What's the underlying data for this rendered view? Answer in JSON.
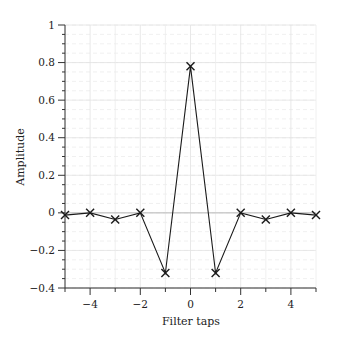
{
  "chart_data": {
    "type": "line",
    "title": "",
    "xlabel": "Filter taps",
    "ylabel": "Amplitude",
    "xlim": [
      -5,
      5
    ],
    "ylim": [
      -0.4,
      1
    ],
    "grid": true,
    "legend": null,
    "x_ticks": [
      -4,
      -2,
      0,
      2,
      4
    ],
    "x_tick_labels": [
      "−4",
      "−2",
      "0",
      "2",
      "4"
    ],
    "y_ticks": [
      -0.4,
      -0.2,
      0,
      0.2,
      0.4,
      0.6,
      0.8,
      1
    ],
    "y_tick_labels": [
      "−0.4",
      "−0.2",
      "0",
      "0.2",
      "0.4",
      "0.6",
      "0.8",
      "1"
    ],
    "series": [
      {
        "name": "filter coefficients",
        "marker": "x",
        "color": "#1a1a1a",
        "x": [
          -5,
          -4,
          -3,
          -2,
          -1,
          0,
          1,
          2,
          3,
          4,
          5
        ],
        "values": [
          -0.012,
          0,
          -0.035,
          0,
          -0.32,
          0.78,
          -0.32,
          0,
          -0.035,
          0,
          -0.012
        ]
      }
    ]
  },
  "colors": {
    "line": "#1a1a1a",
    "axis": "#333333",
    "grid_major": "#e2e2e2",
    "grid_minor": "#ececec",
    "zero_line": "#bdbdbd"
  }
}
